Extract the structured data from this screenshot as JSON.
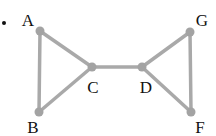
{
  "diagram": {
    "type": "graph",
    "bullet": "•",
    "colors": {
      "edge": "#a9a9a9",
      "node": "#a3a3a3",
      "label": "#111111"
    },
    "nodes": [
      {
        "id": "A",
        "label": "A",
        "x": 40,
        "y": 31,
        "lx": 28,
        "ly": 20
      },
      {
        "id": "B",
        "label": "B",
        "x": 39,
        "y": 112,
        "lx": 33,
        "ly": 127
      },
      {
        "id": "C",
        "label": "C",
        "x": 92,
        "y": 67,
        "lx": 93,
        "ly": 87
      },
      {
        "id": "D",
        "label": "D",
        "x": 142,
        "y": 67,
        "lx": 146,
        "ly": 87
      },
      {
        "id": "G",
        "label": "G",
        "x": 190,
        "y": 32,
        "lx": 202,
        "ly": 20
      },
      {
        "id": "F",
        "label": "F",
        "x": 191,
        "y": 112,
        "lx": 200,
        "ly": 127
      }
    ],
    "edges": [
      [
        "A",
        "B"
      ],
      [
        "A",
        "C"
      ],
      [
        "B",
        "C"
      ],
      [
        "C",
        "D"
      ],
      [
        "D",
        "G"
      ],
      [
        "D",
        "F"
      ],
      [
        "G",
        "F"
      ]
    ]
  }
}
